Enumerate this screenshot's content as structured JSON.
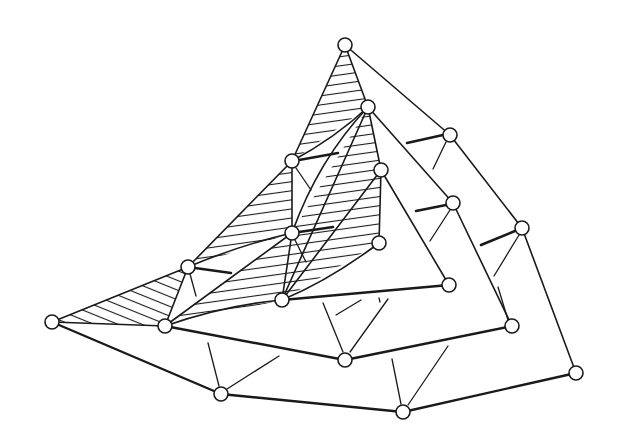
{
  "diagram": {
    "title": "",
    "node_radius": 7,
    "colors": {
      "ink": "#1a1a1a",
      "background": "#ffffff",
      "node_fill": "#ffffff"
    },
    "nodes": [
      {
        "id": "A",
        "x": 345,
        "y": 45
      },
      {
        "id": "B",
        "x": 368,
        "y": 107
      },
      {
        "id": "C",
        "x": 292,
        "y": 161
      },
      {
        "id": "D",
        "x": 381,
        "y": 170
      },
      {
        "id": "E",
        "x": 292,
        "y": 233
      },
      {
        "id": "F",
        "x": 379,
        "y": 243
      },
      {
        "id": "G",
        "x": 188,
        "y": 267
      },
      {
        "id": "H",
        "x": 282,
        "y": 300
      },
      {
        "id": "I",
        "x": 52,
        "y": 322
      },
      {
        "id": "J",
        "x": 165,
        "y": 326
      },
      {
        "id": "S",
        "x": 450,
        "y": 135
      },
      {
        "id": "Q",
        "x": 453,
        "y": 203
      },
      {
        "id": "R",
        "x": 522,
        "y": 228
      },
      {
        "id": "K",
        "x": 449,
        "y": 285
      },
      {
        "id": "L",
        "x": 512,
        "y": 326
      },
      {
        "id": "M",
        "x": 345,
        "y": 360
      },
      {
        "id": "N",
        "x": 221,
        "y": 394
      },
      {
        "id": "O",
        "x": 403,
        "y": 412
      },
      {
        "id": "P",
        "x": 576,
        "y": 373
      }
    ],
    "hatched_regions": [
      [
        "A",
        "B",
        "C"
      ],
      [
        "C",
        "G",
        "E"
      ],
      [
        "B",
        "E",
        "H",
        "D"
      ],
      [
        "D",
        "F",
        "H"
      ],
      [
        "G",
        "I",
        "J"
      ],
      [
        "E",
        "J",
        "H"
      ]
    ]
  }
}
